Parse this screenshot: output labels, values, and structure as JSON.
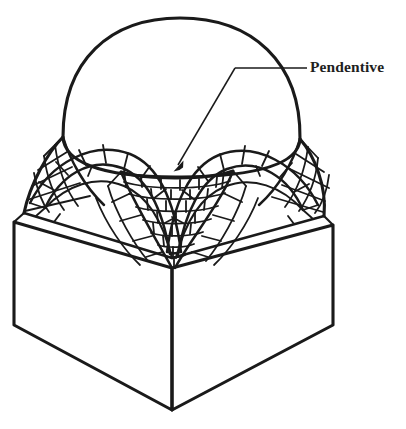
{
  "figure": {
    "kind": "architectural-cutaway-diagram",
    "background_color": "#ffffff",
    "ink_color": "#1a1a1a"
  },
  "annotations": [
    {
      "id": "pendentive",
      "label": "Pendentive",
      "label_x": 310,
      "label_y": 68,
      "leader": {
        "dash_x1": 292,
        "dash_x2": 307,
        "dash_y": 68,
        "elbow_x": 235,
        "elbow_y": 68,
        "horizontal_to_x": 307,
        "arrow_tip_x": 174,
        "arrow_tip_y": 170
      }
    }
  ],
  "parts": {
    "dome": {
      "name": "hemispherical dome",
      "apex_x": 178,
      "apex_y": 18,
      "left_extent_x": 62,
      "right_extent_x": 300
    },
    "pendentives": {
      "name": "pendentive spherical triangles",
      "count_visible": 3,
      "masonry": "coursed brick, staggered joints, radiating near corners"
    },
    "arches": {
      "name": "supporting arches with voussoirs",
      "count_visible": 2,
      "masonry": "radiating wedge-shaped voussoirs"
    },
    "base": {
      "name": "square base / piers",
      "front_corner_x": 172,
      "front_corner_y": 410,
      "top_corner_y": 268,
      "left_edge_x": 14,
      "right_edge_x": 333
    }
  }
}
